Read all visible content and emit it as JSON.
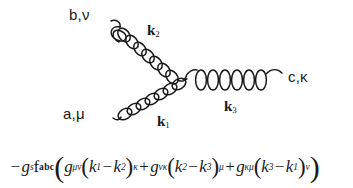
{
  "figure": {
    "type": "feynman-diagram",
    "background_color": "#ffffff",
    "line_color": "#1a1a1a"
  },
  "diagram": {
    "vertex": {
      "x": 185,
      "y": 79
    },
    "legs": [
      {
        "id": "leg-b-nu",
        "particle": "gluon",
        "style": "coil",
        "label": "b,ν",
        "momentum_label": "k",
        "momentum_index": "2",
        "from": {
          "x": 112,
          "y": 22
        },
        "to": {
          "x": 185,
          "y": 79
        },
        "loops": 9,
        "direction": "upper-left"
      },
      {
        "id": "leg-a-mu",
        "particle": "gluon",
        "style": "coil",
        "label": "a,μ",
        "momentum_label": "k",
        "momentum_index": "1",
        "from": {
          "x": 114,
          "y": 120
        },
        "to": {
          "x": 185,
          "y": 79
        },
        "loops": 8,
        "direction": "lower-left"
      },
      {
        "id": "leg-c-kappa",
        "particle": "gluon",
        "style": "coil",
        "label": "c,κ",
        "momentum_label": "k",
        "momentum_index": "3",
        "from": {
          "x": 185,
          "y": 79
        },
        "to": {
          "x": 282,
          "y": 79
        },
        "loops": 6,
        "direction": "right"
      }
    ],
    "labels": {
      "b_nu": "b,ν",
      "c_kappa": "c,κ",
      "a_mu": "a,μ",
      "k1": "k",
      "k1_sub": "1",
      "k2": "k",
      "k2_sub": "2",
      "k3": "k",
      "k3_sub": "3"
    }
  },
  "formula": {
    "plain_text": "-g_s f^{abc} ( g_{μν}(k_1 - k_2)_κ + g_{νκ}(k_2 - k_3)_μ + g_{κμ}(k_3 - k_1)_ν )",
    "tokens": {
      "minus": "−",
      "g_coupling": "g",
      "g_coupling_sub": "s",
      "f_symbol": "f",
      "f_sup": "abc",
      "open_paren": "(",
      "close_paren": ")",
      "metric": "g",
      "metric_sub_1": "μν",
      "metric_sub_2": "νκ",
      "metric_sub_3": "κμ",
      "k": "k",
      "idx_1": "1",
      "idx_2": "2",
      "idx_3": "3",
      "minus_op": "−",
      "plus_op": "+",
      "lower_idx_1": "κ",
      "lower_idx_2": "μ",
      "lower_idx_3": "ν"
    }
  }
}
